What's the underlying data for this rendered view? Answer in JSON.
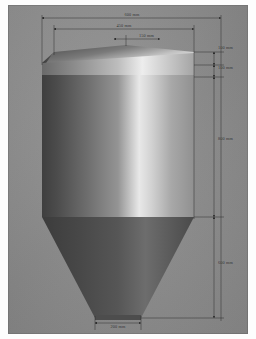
{
  "drawing": {
    "title": "Silo / hopper vessel elevation",
    "units": "mm",
    "background_color": "#8d8d8d",
    "line_color": "#2a2a2a",
    "vessel": {
      "parts": [
        "chamfered-top-lid",
        "cylindrical-body",
        "conical-hopper",
        "outlet"
      ],
      "body_fill_light": "#e9e9e9",
      "body_fill_dark": "#4a4a4a",
      "cone_fill_dark": "#474747",
      "cone_fill_light": "#a9a9a9"
    },
    "dimensions": [
      {
        "id": "overall-width",
        "label": "600 mm",
        "orientation": "horizontal",
        "value": 600,
        "position": "top-outer"
      },
      {
        "id": "top-plate-width",
        "label": "450 mm",
        "orientation": "horizontal",
        "value": 450,
        "position": "top-inner"
      },
      {
        "id": "top-offset",
        "label": "150 mm",
        "orientation": "horizontal",
        "value": 150,
        "position": "top-chamfer"
      },
      {
        "id": "lid-upper",
        "label": "100 mm",
        "orientation": "vertical",
        "value": 100,
        "position": "right-1"
      },
      {
        "id": "lid-lower",
        "label": "100 mm",
        "orientation": "vertical",
        "value": 100,
        "position": "right-2"
      },
      {
        "id": "body-height",
        "label": "800 mm",
        "orientation": "vertical",
        "value": 800,
        "position": "right-3"
      },
      {
        "id": "cone-height",
        "label": "600 mm",
        "orientation": "vertical",
        "value": 600,
        "position": "right-4"
      },
      {
        "id": "outlet-width",
        "label": "200 mm",
        "orientation": "horizontal",
        "value": 200,
        "position": "bottom"
      }
    ]
  }
}
